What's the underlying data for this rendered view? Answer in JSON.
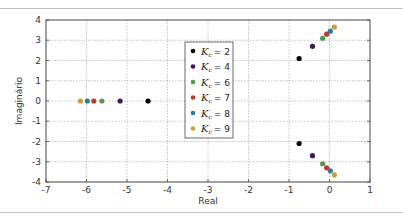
{
  "chart_data": {
    "type": "scatter",
    "title": "",
    "xlabel": "Real",
    "ylabel": "Imaginário",
    "xlim": [
      -7,
      1
    ],
    "ylim": [
      -4,
      4
    ],
    "xticks": [
      -7,
      -6,
      -5,
      -4,
      -3,
      -2,
      -1,
      0,
      1
    ],
    "yticks": [
      -4,
      -3,
      -2,
      -1,
      0,
      1,
      2,
      3,
      4
    ],
    "grid": true,
    "legend_position": "center-left inside (around x=-2.4..-1.6, y=2.5..-1.2)",
    "series": [
      {
        "name": "K_c = 2",
        "color": "#000000",
        "points": [
          [
            -4.48,
            0
          ],
          [
            -0.75,
            2.1
          ],
          [
            -0.75,
            -2.1
          ]
        ]
      },
      {
        "name": "K_c = 4",
        "color": "#3d1a5a",
        "points": [
          [
            -5.17,
            0
          ],
          [
            -0.42,
            2.7
          ],
          [
            -0.42,
            -2.7
          ]
        ]
      },
      {
        "name": "K_c = 6",
        "color": "#4f9a4f",
        "points": [
          [
            -5.62,
            0
          ],
          [
            -0.17,
            3.1
          ],
          [
            -0.17,
            -3.1
          ]
        ]
      },
      {
        "name": "K_c = 7",
        "color": "#c0392b",
        "points": [
          [
            -5.82,
            0
          ],
          [
            -0.07,
            3.3
          ],
          [
            -0.07,
            -3.3
          ]
        ]
      },
      {
        "name": "K_c = 8",
        "color": "#2a7f95",
        "points": [
          [
            -5.98,
            0
          ],
          [
            0.02,
            3.45
          ],
          [
            0.02,
            -3.45
          ]
        ]
      },
      {
        "name": "K_c = 9",
        "color": "#d09a3a",
        "points": [
          [
            -6.15,
            0
          ],
          [
            0.12,
            3.65
          ],
          [
            0.12,
            -3.65
          ]
        ]
      }
    ]
  },
  "legend": {
    "items": [
      {
        "sym": "K",
        "sub": "c",
        "eq": "= 2",
        "color": "#000000"
      },
      {
        "sym": "K",
        "sub": "c",
        "eq": "= 4",
        "color": "#3d1a5a"
      },
      {
        "sym": "K",
        "sub": "c",
        "eq": "= 6",
        "color": "#4f9a4f"
      },
      {
        "sym": "K",
        "sub": "c",
        "eq": "= 7",
        "color": "#c0392b"
      },
      {
        "sym": "K",
        "sub": "c",
        "eq": "= 8",
        "color": "#2a7f95"
      },
      {
        "sym": "K",
        "sub": "c",
        "eq": "= 9",
        "color": "#d09a3a"
      }
    ]
  }
}
